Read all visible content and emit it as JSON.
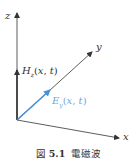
{
  "figure": {
    "axes": {
      "x_label": "x",
      "y_label": "y",
      "z_label": "z"
    },
    "vectors": {
      "h_label": "H_z(x, t)",
      "h_main": "H",
      "h_sub": "z",
      "h_args": "(x, t)",
      "e_main": "E",
      "e_sub": "y",
      "e_args": "(x, t)"
    },
    "colors": {
      "axis": "#333333",
      "e_vector": "#4a90d9",
      "h_vector": "#333333"
    },
    "caption": {
      "prefix": "図",
      "number": "5.1",
      "title": "電磁波"
    }
  }
}
